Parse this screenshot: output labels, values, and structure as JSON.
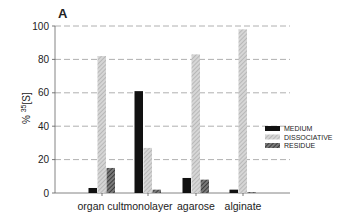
{
  "chart_data": {
    "type": "bar",
    "panel_label": "A",
    "title": "",
    "xlabel": "",
    "ylabel": "% 35[S]",
    "ylabel_display": {
      "prefix": "% ",
      "sup": "35",
      "suffix": "[S]"
    },
    "ylim": [
      0,
      100
    ],
    "yticks": [
      0,
      20,
      40,
      60,
      80,
      100
    ],
    "grid": "horizontal dashed",
    "legend_position": "right, middle",
    "categories": [
      "organ cult.",
      "monolayer",
      "agarose",
      "alginate"
    ],
    "series": [
      {
        "name": "MEDIUM",
        "values": [
          3,
          61,
          9,
          2
        ],
        "fill": "#111111",
        "pattern": "solid"
      },
      {
        "name": "DISSOCIATIVE",
        "values": [
          82,
          27,
          83,
          98
        ],
        "fill": "#bdbdbd",
        "pattern": "light-hatch"
      },
      {
        "name": "RESIDUE",
        "values": [
          15,
          2,
          8,
          0.5
        ],
        "fill": "#555555",
        "pattern": "dark-hatch"
      }
    ]
  }
}
